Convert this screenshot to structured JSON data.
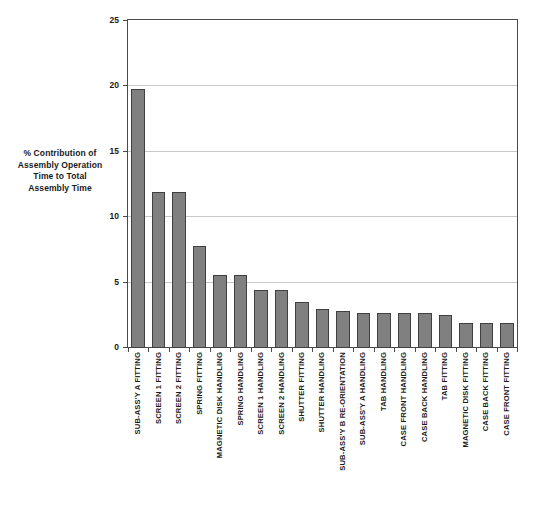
{
  "chart_data": {
    "type": "bar",
    "title": "",
    "xlabel": "",
    "ylabel": "% Contribution of Assembly Operation Time to Total Assembly Time",
    "ylim": [
      0,
      25
    ],
    "yticks": [
      0,
      5,
      10,
      15,
      20,
      25
    ],
    "grid": true,
    "legend": "none",
    "bar_color": "#808080",
    "bar_border_color": "#404040",
    "categories": [
      "SUB-ASS'Y A FITTING",
      "SCREEN 1 FITTING",
      "SCREEN 2 FITTING",
      "SPRING FITTING",
      "MAGNETIC DISK HANDLING",
      "SPRING HANDLING",
      "SCREEN 1 HANDLING",
      "SCREEN 2 HANDLING",
      "SHUTTER FITTING",
      "SHUTTER HANDLING",
      "SUB-ASS'Y B RE-ORIENTATION",
      "SUB-ASS'Y A HANDLING",
      "TAB HANDLING",
      "CASE FRONT HANDLING",
      "CASE BACK HANDLING",
      "TAB FITTING",
      "MAGNETIC DISK FITTING",
      "CASE BACK FITTING",
      "CASE FRONT FITTING"
    ],
    "values": [
      19.8,
      11.9,
      11.9,
      7.8,
      5.6,
      5.6,
      4.4,
      4.4,
      3.5,
      3.0,
      2.8,
      2.7,
      2.7,
      2.7,
      2.7,
      2.5,
      1.9,
      1.9,
      1.9
    ]
  },
  "axis": {
    "y_title_lines": [
      "% Contribution of",
      "Assembly Operation",
      "Time to Total",
      "Assembly Time"
    ],
    "y_tick_labels": [
      "25",
      "20",
      "15",
      "10",
      "5",
      "0"
    ]
  }
}
